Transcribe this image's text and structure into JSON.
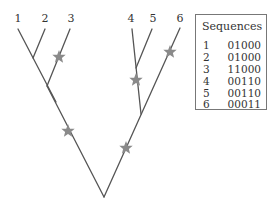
{
  "tree": {
    "leaves": [
      {
        "label": "1",
        "x": 18,
        "y": 20
      },
      {
        "label": "2",
        "x": 45,
        "y": 20
      },
      {
        "label": "3",
        "x": 70,
        "y": 20
      },
      {
        "label": "4",
        "x": 132,
        "y": 20
      },
      {
        "label": "5",
        "x": 153,
        "y": 20
      },
      {
        "label": "6",
        "x": 180,
        "y": 20
      }
    ],
    "mutation_marker": "star",
    "line_color": "#555555",
    "star_color": "#888888"
  },
  "sequences": {
    "title": "Sequences",
    "rows": [
      {
        "id": "1",
        "seq": "01000"
      },
      {
        "id": "2",
        "seq": "01000"
      },
      {
        "id": "3",
        "seq": "11000"
      },
      {
        "id": "4",
        "seq": "00110"
      },
      {
        "id": "5",
        "seq": "00110"
      },
      {
        "id": "6",
        "seq": "00011"
      }
    ]
  }
}
